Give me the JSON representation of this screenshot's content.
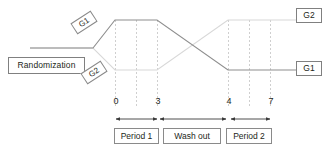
{
  "diagram": {
    "type": "crossover-study-timeline",
    "randomization_label": "Randomization",
    "group_labels": {
      "g1_start": "G1",
      "g2_start": "G2",
      "g2_end": "G2",
      "g1_end": "G1"
    },
    "axis": {
      "tick_labels": [
        "0",
        "3",
        "4",
        "7"
      ],
      "tick_values": [
        0,
        3,
        4,
        7
      ]
    },
    "phases": [
      {
        "name": "period-1",
        "label": "Period 1",
        "start": 0,
        "end": 3
      },
      {
        "name": "wash-out",
        "label": "Wash out",
        "start": 3,
        "end": 4
      },
      {
        "name": "period-2",
        "label": "Period 2",
        "start": 4,
        "end": 7
      }
    ],
    "colors": {
      "line_g1": "#808080",
      "line_g2": "#d4d4d4",
      "gridline": "#cfcfcf",
      "box_border": "#808080",
      "text": "#231f20",
      "background": "#ffffff"
    }
  }
}
